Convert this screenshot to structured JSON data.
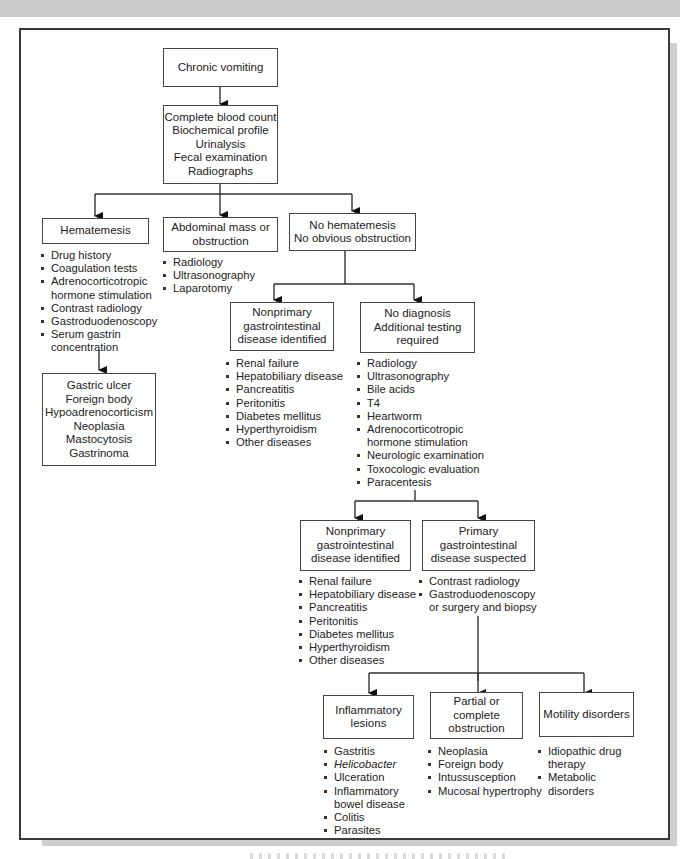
{
  "diagram": {
    "type": "flowchart",
    "nodes": {
      "root": {
        "lines": [
          "Chronic vomiting"
        ]
      },
      "tests": {
        "lines": [
          "Complete blood count",
          "Biochemical profile",
          "Urinalysis",
          "Fecal examination",
          "Radiographs"
        ]
      },
      "hematemesis": {
        "lines": [
          "Hematemesis"
        ],
        "items": [
          "Drug history",
          "Coagulation tests",
          "Adrenocorticotropic hormone stimulation",
          "Contrast radiology",
          "Gastroduodenoscopy",
          "Serum gastrin concentration"
        ]
      },
      "hematemesis_dx": {
        "lines": [
          "Gastric ulcer",
          "Foreign body",
          "Hypoadrenocorticism",
          "Neoplasia",
          "Mastocytosis",
          "Gastrinoma"
        ]
      },
      "abdominal": {
        "lines": [
          "Abdominal mass or",
          "obstruction"
        ],
        "items": [
          "Radiology",
          "Ultrasonography",
          "Laparotomy"
        ]
      },
      "no_hematemesis": {
        "lines": [
          "No hematemesis",
          "No obvious obstruction"
        ]
      },
      "nonprimary_1": {
        "lines": [
          "Nonprimary",
          "gastrointestinal",
          "disease identified"
        ],
        "items": [
          "Renal failure",
          "Hepatobiliary disease",
          "Pancreatitis",
          "Peritonitis",
          "Diabetes mellitus",
          "Hyperthyroidism",
          "Other diseases"
        ]
      },
      "no_diagnosis": {
        "lines": [
          "No diagnosis",
          "Additional testing",
          "required"
        ],
        "items": [
          "Radiology",
          "Ultrasonography",
          "Bile acids",
          "T4",
          "Heartworm",
          "Adrenocorticotropic hormone stimulation",
          "Neurologic examination",
          "Toxocologic evaluation",
          "Paracentesis"
        ]
      },
      "nonprimary_2": {
        "lines": [
          "Nonprimary",
          "gastrointestinal",
          "disease identified"
        ],
        "items": [
          "Renal failure",
          "Hepatobiliary disease",
          "Pancreatitis",
          "Peritonitis",
          "Diabetes mellitus",
          "Hyperthyroidism",
          "Other diseases"
        ]
      },
      "primary": {
        "lines": [
          "Primary",
          "gastrointestinal",
          "disease suspected"
        ],
        "items": [
          "Contrast radiology",
          "Gastroduodenoscopy or surgery and biopsy"
        ]
      },
      "inflammatory": {
        "lines": [
          "Inflammatory",
          "lesions"
        ],
        "items": [
          "Gastritis",
          "Helicobacter",
          "Ulceration",
          "Inflammatory bowel disease",
          "Colitis",
          "Parasites"
        ]
      },
      "obstruction": {
        "lines": [
          "Partial or complete",
          "obstruction"
        ],
        "items": [
          "Neoplasia",
          "Foreign body",
          "Intussusception",
          "Mucosal hypertrophy"
        ]
      },
      "motility": {
        "lines": [
          "Motility disorders"
        ],
        "items": [
          "Idiopathic drug therapy",
          "Metabolic disorders"
        ]
      }
    },
    "edges": [
      [
        "root",
        "tests"
      ],
      [
        "tests",
        "hematemesis"
      ],
      [
        "tests",
        "abdominal"
      ],
      [
        "tests",
        "no_hematemesis"
      ],
      [
        "hematemesis",
        "hematemesis_dx"
      ],
      [
        "no_hematemesis",
        "nonprimary_1"
      ],
      [
        "no_hematemesis",
        "no_diagnosis"
      ],
      [
        "no_diagnosis",
        "nonprimary_2"
      ],
      [
        "no_diagnosis",
        "primary"
      ],
      [
        "primary",
        "inflammatory"
      ],
      [
        "primary",
        "obstruction"
      ],
      [
        "primary",
        "motility"
      ]
    ],
    "colors": {
      "border": "#444444",
      "frame": "#3a3a3a",
      "shadow": "#cfcfcf",
      "top_band": "#c9c9c9",
      "text": "#222222"
    }
  }
}
